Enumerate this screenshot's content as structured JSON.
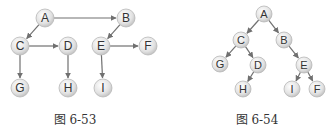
{
  "figures": [
    {
      "caption": "图 6-53",
      "caption_pos": [
        75,
        110
      ],
      "radius": 9,
      "nodes": [
        {
          "id": "A",
          "x": 45,
          "y": 18
        },
        {
          "id": "B",
          "x": 126,
          "y": 18
        },
        {
          "id": "C",
          "x": 20,
          "y": 46
        },
        {
          "id": "D",
          "x": 68,
          "y": 46
        },
        {
          "id": "E",
          "x": 101,
          "y": 46
        },
        {
          "id": "F",
          "x": 148,
          "y": 46
        },
        {
          "id": "G",
          "x": 20,
          "y": 88
        },
        {
          "id": "H",
          "x": 68,
          "y": 88
        },
        {
          "id": "I",
          "x": 103,
          "y": 88
        }
      ],
      "edges": [
        [
          "A",
          "B"
        ],
        [
          "A",
          "C"
        ],
        [
          "C",
          "D"
        ],
        [
          "C",
          "G"
        ],
        [
          "D",
          "H"
        ],
        [
          "B",
          "E"
        ],
        [
          "E",
          "F"
        ],
        [
          "E",
          "I"
        ]
      ]
    },
    {
      "caption": "图 6-54",
      "caption_pos": [
        257,
        110
      ],
      "radius": 8,
      "nodes": [
        {
          "id": "A",
          "x": 264,
          "y": 14
        },
        {
          "id": "C",
          "x": 241,
          "y": 40
        },
        {
          "id": "B",
          "x": 284,
          "y": 40
        },
        {
          "id": "G",
          "x": 220,
          "y": 64
        },
        {
          "id": "D",
          "x": 258,
          "y": 65
        },
        {
          "id": "E",
          "x": 304,
          "y": 65
        },
        {
          "id": "H",
          "x": 243,
          "y": 89
        },
        {
          "id": "I",
          "x": 292,
          "y": 89
        },
        {
          "id": "F",
          "x": 317,
          "y": 89
        }
      ],
      "edges": [
        [
          "A",
          "C"
        ],
        [
          "A",
          "B"
        ],
        [
          "C",
          "G"
        ],
        [
          "C",
          "D"
        ],
        [
          "D",
          "H"
        ],
        [
          "B",
          "E"
        ],
        [
          "E",
          "I"
        ],
        [
          "E",
          "F"
        ]
      ]
    }
  ],
  "colors": {
    "edge": "#707070",
    "node_fill": "#e6e6e6",
    "node_stroke": "#b8b8b8",
    "label": "#333333"
  }
}
